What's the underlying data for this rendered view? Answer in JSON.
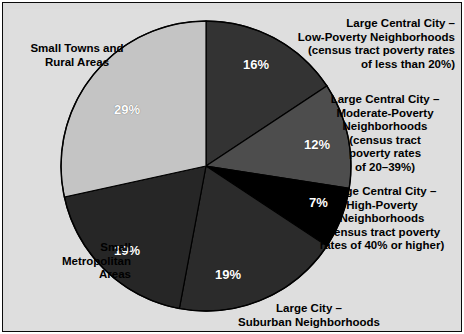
{
  "chart_data": {
    "type": "pie",
    "title": "",
    "subtitle": "",
    "xlabel": "",
    "ylabel": "",
    "legend_position": "callout-labels",
    "grid": false,
    "units": "percent",
    "total": 102,
    "start_angle_deg": 0,
    "direction": "clockwise",
    "categories": [
      "Large Central City – Low-Poverty Neighborhoods (census tract poverty rates of less than 20%)",
      "Large Central City – Moderate-Poverty Neighborhoods (census tract poverty rates of 20–39%)",
      "Large Central City – High-Poverty Neighborhoods (census tract poverty rates of 40% or higher)",
      "Large City – Suburban Neighborhoods",
      "Small Metropolitan Areas",
      "Small Towns and Rural Areas"
    ],
    "values": [
      16,
      12,
      7,
      19,
      19,
      29
    ],
    "slices": [
      {
        "key": "low-poverty",
        "percent_label": "16%",
        "value": 16,
        "color": "#333333",
        "label_color": "#ffffff",
        "start_deg": 0,
        "end_deg": 57.6
      },
      {
        "key": "moderate-poverty",
        "percent_label": "12%",
        "value": 12,
        "color": "#4d4d4d",
        "label_color": "#ffffff",
        "start_deg": 57.6,
        "end_deg": 100.8
      },
      {
        "key": "high-poverty",
        "percent_label": "7%",
        "value": 7,
        "color": "#000000",
        "label_color": "#ffffff",
        "start_deg": 100.8,
        "end_deg": 126.0
      },
      {
        "key": "suburban",
        "percent_label": "19%",
        "value": 19,
        "color": "#2b2b2b",
        "label_color": "#ffffff",
        "start_deg": 126.0,
        "end_deg": 194.4
      },
      {
        "key": "small-metro",
        "percent_label": "19%",
        "value": 19,
        "color": "#262626",
        "label_color": "#ffffff",
        "start_deg": 194.4,
        "end_deg": 262.8
      },
      {
        "key": "small-towns-rural",
        "percent_label": "29%",
        "value": 29,
        "color": "#c4c4c4",
        "label_color": "#ffffff",
        "start_deg": 262.8,
        "end_deg": 360.0
      }
    ]
  },
  "callouts": {
    "low_poverty": "Large Central City –\nLow-Poverty Neighborhoods\n(census tract poverty rates\nof less than 20%)",
    "moderate_poverty": "Large Central City –\nModerate-Poverty\nNeighborhoods\n(census tract\npoverty rates\nof 20–39%)",
    "high_poverty": "Large Central City –\nHigh-Poverty\nNeighborhoods\n(census tract poverty\nrates of 40% or higher)",
    "suburban": "Large City –\nSuburban Neighborhoods",
    "small_metro": "Small\nMetropolitan\nAreas",
    "small_towns": "Small Towns and\nRural Areas"
  },
  "percent_labels": {
    "low_poverty": "16%",
    "moderate_poverty": "12%",
    "high_poverty": "7%",
    "suburban": "19%",
    "small_metro": "19%",
    "small_towns": "29%"
  },
  "colors": {
    "panel_background": "#dedede",
    "frame": "#0a0a0a",
    "slice_outline": "#000000",
    "text": "#000000",
    "percent_text": "#ffffff"
  }
}
